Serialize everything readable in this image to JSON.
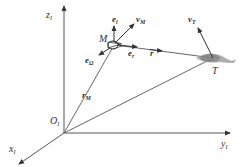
{
  "diagram": {
    "type": "3d-coordinate-vector-diagram",
    "colors": {
      "line": "#444444",
      "text": "#333333",
      "fish": "#888888"
    },
    "axes": {
      "z": {
        "label": "z",
        "sub": "I"
      },
      "y": {
        "label": "y",
        "sub": "I"
      },
      "x": {
        "label": "x",
        "sub": "I"
      },
      "origin": {
        "label": "O",
        "sub": "I"
      }
    },
    "points": {
      "M": {
        "label": "M"
      },
      "T": {
        "label": "T"
      }
    },
    "vectors": {
      "e_l": {
        "label": "e",
        "sub": "l"
      },
      "v_M": {
        "label": "v",
        "sub": "M"
      },
      "e_Omega": {
        "label": "e",
        "sub": "Ω"
      },
      "e_r": {
        "label": "e",
        "sub": "r"
      },
      "r": {
        "label": "r"
      },
      "r_M": {
        "label": "r",
        "sub": "M"
      },
      "v_T": {
        "label": "v",
        "sub": "T"
      }
    }
  }
}
